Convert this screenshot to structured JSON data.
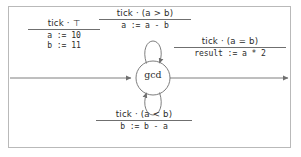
{
  "diagram": {
    "type": "state-machine",
    "title": "",
    "frame": {
      "border_color": "#b9b9b9",
      "background": "#ffffff"
    },
    "states": [
      {
        "id": "gcd",
        "label": "gcd",
        "shape": "circle",
        "cx": 153,
        "cy": 78,
        "r": 17
      }
    ],
    "transitions": [
      {
        "id": "init",
        "kind": "incoming",
        "from": "",
        "to": "gcd",
        "guard": "tick · ⊤",
        "actions": [
          "a := 10",
          "b := 11"
        ]
      },
      {
        "id": "decrement-a",
        "kind": "self-loop-top",
        "from": "gcd",
        "to": "gcd",
        "guard": "tick · (a > b)",
        "actions": [
          "a := a - b"
        ]
      },
      {
        "id": "result",
        "kind": "outgoing",
        "from": "gcd",
        "to": "",
        "guard": "tick · (a = b)",
        "actions": [
          "result := a * 2"
        ]
      },
      {
        "id": "decrement-b",
        "kind": "self-loop-bottom",
        "from": "gcd",
        "to": "gcd",
        "guard": "tick · (a < b)",
        "actions": [
          "b := b - a"
        ]
      }
    ],
    "colors": {
      "stroke": "#6f6f6f",
      "text": "#2b2b2b",
      "frame": "#b9b9b9"
    }
  }
}
